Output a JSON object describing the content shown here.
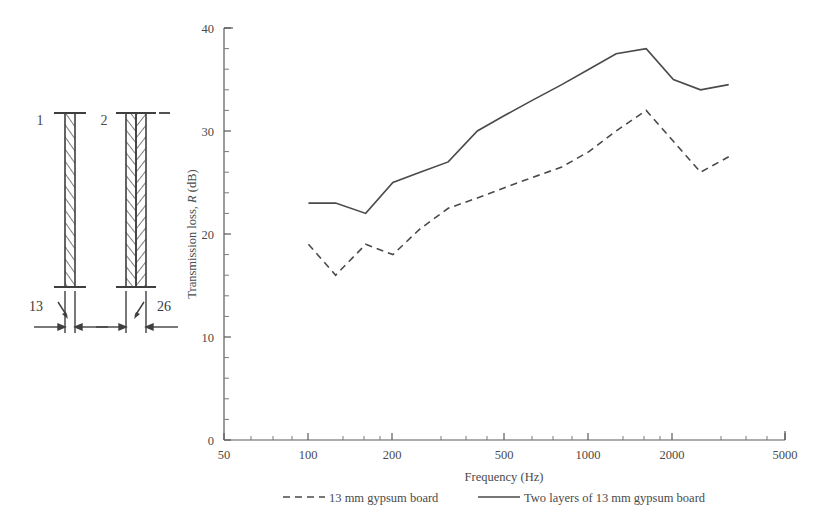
{
  "figure": {
    "background": "#ffffff",
    "ink_color": "#4a4a4a"
  },
  "diagram": {
    "name": "wall-section-diagram",
    "panels": [
      {
        "label": "1",
        "description": "single layer 13 mm gypsum board",
        "hatch": "diagonal"
      },
      {
        "label": "2",
        "description": "two layers of 13 mm gypsum board",
        "hatch": "chevron"
      }
    ],
    "dimensions": [
      {
        "label": "13",
        "unit": "mm",
        "applies_to": "1"
      },
      {
        "label": "26",
        "unit": "mm",
        "applies_to": "2"
      }
    ]
  },
  "chart_data": {
    "type": "line",
    "title": "",
    "xlabel": "Frequency (Hz)",
    "ylabel": "Transmission loss, R (dB)",
    "ylabel_plain": "Transmission loss, ",
    "ylabel_italic": "R",
    "ylabel_tail": " (dB)",
    "xscale": "log",
    "xlim": [
      50,
      5000
    ],
    "ylim": [
      0,
      40
    ],
    "grid": false,
    "xticks": [
      50,
      100,
      200,
      500,
      1000,
      2000,
      5000
    ],
    "xticklabels": [
      "50",
      "100",
      "200",
      "500",
      "1000",
      "2000",
      "5000"
    ],
    "yticks": [
      0,
      10,
      20,
      30,
      40
    ],
    "yticklabels": [
      "0",
      "10",
      "20",
      "30",
      "40"
    ],
    "yminorticks": [
      2,
      4,
      6,
      8,
      12,
      14,
      16,
      18,
      22,
      24,
      26,
      28,
      32,
      34,
      36,
      38
    ],
    "legend_position": "below-axes",
    "series": [
      {
        "name": "13 mm gypsum board",
        "style": "dashed",
        "color": "#4a4a4a",
        "x": [
          100,
          125,
          160,
          200,
          250,
          315,
          400,
          500,
          630,
          800,
          1000,
          1250,
          1600,
          2000,
          2500,
          3150
        ],
        "y": [
          19.0,
          16.0,
          19.0,
          18.0,
          20.5,
          22.5,
          23.5,
          24.5,
          25.5,
          26.5,
          28.0,
          30.0,
          32.0,
          29.0,
          26.0,
          27.5
        ]
      },
      {
        "name": "Two layers of 13 mm gypsum board",
        "style": "solid",
        "color": "#4a4a4a",
        "x": [
          100,
          125,
          160,
          200,
          250,
          315,
          400,
          500,
          630,
          800,
          1000,
          1250,
          1600,
          2000,
          2500,
          3150
        ],
        "y": [
          23.0,
          23.0,
          22.0,
          25.0,
          26.0,
          27.0,
          30.0,
          31.5,
          33.0,
          34.5,
          36.0,
          37.5,
          38.0,
          35.0,
          34.0,
          34.5
        ]
      }
    ]
  },
  "legend": {
    "entries": [
      {
        "label": "13 mm gypsum board",
        "style": "dashed"
      },
      {
        "label": "Two layers of 13 mm gypsum board",
        "style": "solid"
      }
    ]
  }
}
